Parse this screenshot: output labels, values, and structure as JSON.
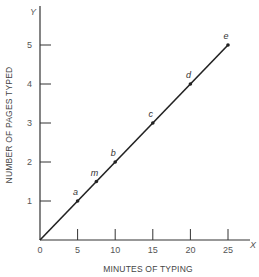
{
  "chart_data": {
    "type": "line",
    "title": "",
    "xlabel": "MINUTES OF TYPING",
    "ylabel": "NUMBER OF PAGES TYPED",
    "x_axis_letter": "X",
    "y_axis_letter": "Y",
    "xlim": [
      0,
      27
    ],
    "ylim": [
      0,
      6
    ],
    "x_ticks": [
      0,
      5,
      10,
      15,
      20,
      25
    ],
    "y_ticks": [
      1,
      2,
      3,
      4,
      5
    ],
    "grid": false,
    "legend": "none",
    "series": [
      {
        "name": "pages typed",
        "x": [
          0,
          25
        ],
        "y": [
          0,
          5
        ]
      }
    ],
    "points": [
      {
        "label": "a",
        "x": 5,
        "y": 1
      },
      {
        "label": "m",
        "x": 7.5,
        "y": 1.5
      },
      {
        "label": "b",
        "x": 10,
        "y": 2
      },
      {
        "label": "c",
        "x": 15,
        "y": 3
      },
      {
        "label": "d",
        "x": 20,
        "y": 4
      },
      {
        "label": "e",
        "x": 25,
        "y": 5
      }
    ]
  }
}
